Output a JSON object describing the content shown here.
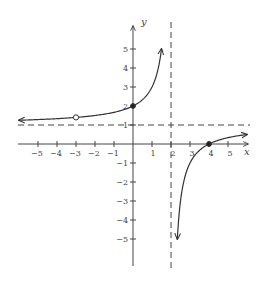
{
  "chart_data": {
    "type": "line",
    "title": "",
    "xlabel": "x",
    "ylabel": "y",
    "xlim": [
      -6,
      6
    ],
    "ylim": [
      -6,
      6
    ],
    "grid": false,
    "x_ticks": [
      -5,
      -4,
      -3,
      -2,
      -1,
      1,
      2,
      3,
      4,
      5
    ],
    "y_ticks": [
      -5,
      -4,
      -3,
      -2,
      -1,
      1,
      2,
      3,
      4,
      5
    ],
    "function": "f(x) = (x - 4)/(x - 2), x != -3",
    "asymptotes": {
      "vertical": {
        "x": 2,
        "style": "dashed"
      },
      "horizontal": {
        "y": 1,
        "style": "dashed"
      }
    },
    "series": [
      {
        "name": "left-branch",
        "x": [
          -6,
          -5,
          -4,
          -3,
          -2,
          -1,
          0,
          0.5,
          1,
          1.25,
          1.5
        ],
        "y": [
          1.25,
          1.29,
          1.33,
          1.4,
          1.5,
          1.67,
          2,
          2.33,
          3,
          3.67,
          5
        ],
        "arrows": [
          "left-end",
          "right-end"
        ]
      },
      {
        "name": "right-branch",
        "x": [
          2.33,
          2.5,
          3,
          3.5,
          4,
          4.5,
          5,
          5.5,
          6
        ],
        "y": [
          -5,
          -3,
          -1,
          -0.33,
          0,
          0.2,
          0.33,
          0.43,
          0.5
        ],
        "arrows": [
          "left-end",
          "right-end"
        ]
      }
    ],
    "points": [
      {
        "x": -3,
        "y": 1.4,
        "type": "open"
      },
      {
        "x": 0,
        "y": 2,
        "type": "closed"
      },
      {
        "x": 4,
        "y": 0,
        "type": "closed"
      }
    ]
  },
  "labels": {
    "x_axis": "x",
    "y_axis": "y",
    "x_ticks": [
      "−5",
      "−4",
      "−3",
      "−2",
      "−1",
      "1",
      "2",
      "3",
      "4",
      "5"
    ],
    "y_ticks": [
      "5",
      "4",
      "3",
      "2",
      "1",
      "−1",
      "−2",
      "−3",
      "−4",
      "−5"
    ]
  },
  "colors": {
    "axis": "#444444",
    "curve": "#333333",
    "asymptote": "#444444"
  }
}
